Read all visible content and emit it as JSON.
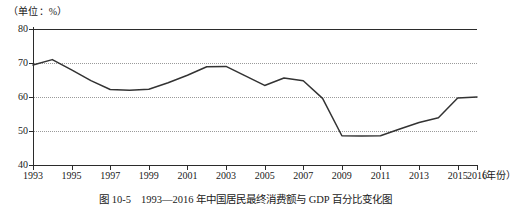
{
  "figure": {
    "unit_label": "（单位：%）",
    "caption": "图 10-5　1993—2016 年中国居民最终消费额与 GDP 百分比变化图"
  },
  "chart_data": {
    "type": "line",
    "title": "",
    "subtitle": "",
    "xlabel": "（年份）",
    "ylabel": "（单位：%）",
    "xlim": [
      1993,
      2016
    ],
    "ylim": [
      40,
      80
    ],
    "yticks": [
      40,
      50,
      60,
      70,
      80
    ],
    "ytick_labels": [
      "40",
      "50",
      "60",
      "70",
      "80"
    ],
    "gridlines_y": [
      50,
      60,
      70
    ],
    "grid": true,
    "legend": null,
    "legend_position": "none",
    "x": [
      1993,
      1994,
      1995,
      1996,
      1997,
      1998,
      1999,
      2000,
      2001,
      2002,
      2003,
      2004,
      2005,
      2006,
      2007,
      2008,
      2009,
      2010,
      2011,
      2012,
      2013,
      2014,
      2015,
      2016
    ],
    "xtick_labels": [
      "1993",
      "1995",
      "1997",
      "1999",
      "2001",
      "2003",
      "2005",
      "2007",
      "2009",
      "2011",
      "2013",
      "2015",
      "2016"
    ],
    "xticks": [
      1993,
      1995,
      1997,
      1999,
      2001,
      2003,
      2005,
      2007,
      2009,
      2011,
      2013,
      2015,
      2016
    ],
    "series": [
      {
        "name": "居民最终消费额占 GDP 百分比",
        "color": "#333333",
        "values": [
          69.4,
          71.0,
          68.0,
          64.8,
          62.2,
          62.0,
          62.3,
          64.2,
          66.4,
          68.9,
          69.0,
          66.2,
          63.4,
          65.6,
          64.8,
          59.6,
          48.6,
          48.5,
          48.6,
          50.6,
          52.5,
          53.9,
          59.7,
          60.0
        ]
      }
    ],
    "annotations": []
  }
}
